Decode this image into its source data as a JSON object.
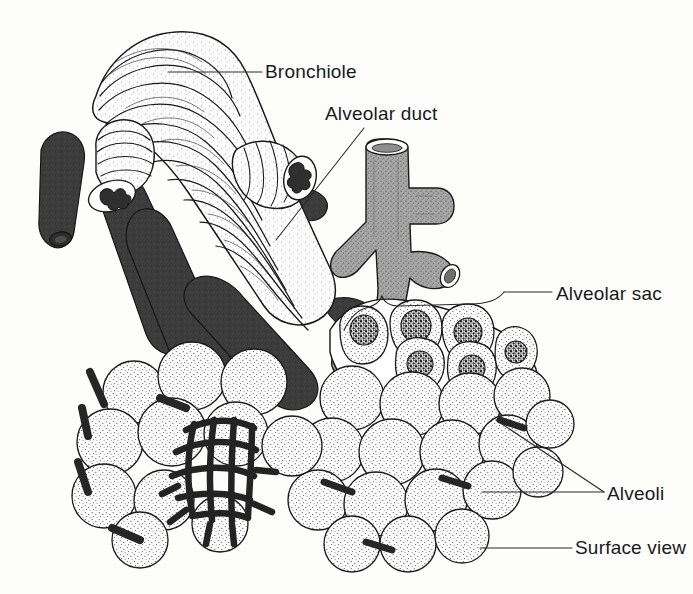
{
  "figure": {
    "kind": "line-drawing",
    "background_color": "#fdfdfc",
    "ink_color": "#1a1a1a",
    "vessel_color": "#3a3a3a",
    "duct_fill_color": "#9a9a9a",
    "stipple_color": "#555555"
  },
  "labels": {
    "bronchiole": "Bronchiole",
    "alveolar_duct": "Alveolar duct",
    "alveolar_sac": "Alveolar sac",
    "alveoli": "Alveoli",
    "surface_view": "Surface view"
  },
  "structures": [
    {
      "name": "bronchiole",
      "description": "large tube wrapped in spiral smooth-muscle bands, two cut stumps with star-shaped lumens"
    },
    {
      "name": "alveolar-duct",
      "description": "gray stippled branching tube with open lumen at top and cut side branch"
    },
    {
      "name": "alveolar-sac",
      "description": "cluster of cut-open alveoli with dark stippled interiors"
    },
    {
      "name": "alveoli-cluster-left",
      "description": "grape-like cluster of stippled alveoli with dark capillary mesh"
    },
    {
      "name": "alveoli-cluster-right",
      "description": "grape-like cluster of stippled alveoli, surface view"
    },
    {
      "name": "pulmonary-vessels",
      "description": "dark branching blood vessels crossing the bronchiole"
    },
    {
      "name": "capillary-network",
      "description": "dark mesh of capillaries over one alveolus"
    }
  ],
  "leaders": [
    {
      "name": "leader-bronchiole",
      "from": "bronchiole wall",
      "to": "Bronchiole"
    },
    {
      "name": "leader-alveolar-duct",
      "from": "alveolar duct wall",
      "to": "Alveolar duct"
    },
    {
      "name": "leader-alveolar-sac",
      "from": "brace over alveolar sac",
      "to": "Alveolar sac"
    },
    {
      "name": "leader-alveoli-upper",
      "from": "alveolus in sac",
      "to": "Alveoli"
    },
    {
      "name": "leader-alveoli-lower",
      "from": "alveolus surface",
      "to": "Alveoli"
    },
    {
      "name": "leader-surface-view",
      "from": "alveoli cluster surface",
      "to": "Surface view"
    }
  ]
}
